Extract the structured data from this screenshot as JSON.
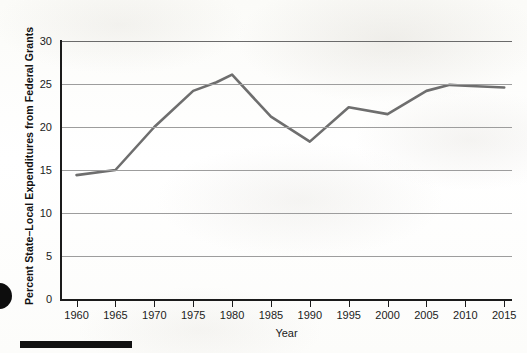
{
  "chart_data": {
    "type": "line",
    "title": "",
    "xlabel": "Year",
    "ylabel": "Percent State–Local Expenditures from Federal Grants",
    "xlim": [
      1958,
      2016
    ],
    "ylim": [
      0,
      30
    ],
    "xticks": [
      1960,
      1965,
      1970,
      1975,
      1980,
      1985,
      1990,
      1995,
      2000,
      2005,
      2010,
      2015
    ],
    "yticks": [
      0,
      5,
      10,
      15,
      20,
      25,
      30
    ],
    "grid": "horizontal",
    "legend": "none",
    "line_color": "#6e6e6e",
    "line_width": 2.6,
    "series": [
      {
        "name": "Percent State–Local Expenditures from Federal Grants",
        "x": [
          1960,
          1965,
          1970,
          1975,
          1978,
          1980,
          1985,
          1990,
          1995,
          2000,
          2005,
          2008,
          2010,
          2015
        ],
        "values": [
          14.4,
          15.0,
          20.0,
          24.2,
          25.2,
          26.1,
          21.2,
          18.3,
          22.3,
          21.5,
          24.2,
          24.9,
          24.8,
          24.6
        ]
      }
    ]
  },
  "axes": {
    "x_title": "Year",
    "y_title": "Percent State–Local Expenditures from Federal Grants",
    "x_tick_labels": [
      "1960",
      "1965",
      "1970",
      "1975",
      "1980",
      "1985",
      "1990",
      "1995",
      "2000",
      "2005",
      "2010",
      "2015"
    ],
    "y_tick_labels": [
      "0",
      "5",
      "10",
      "15",
      "20",
      "25",
      "30"
    ]
  },
  "artifacts": {
    "footer_bar_name": "page-footer-rule",
    "margin_dot_name": "page-margin-ink-dot"
  },
  "colors": {
    "line": "#6e6e6e",
    "grid": "#9d9d9d",
    "axis": "#1b1b1b",
    "page": "#fdfdfb"
  }
}
